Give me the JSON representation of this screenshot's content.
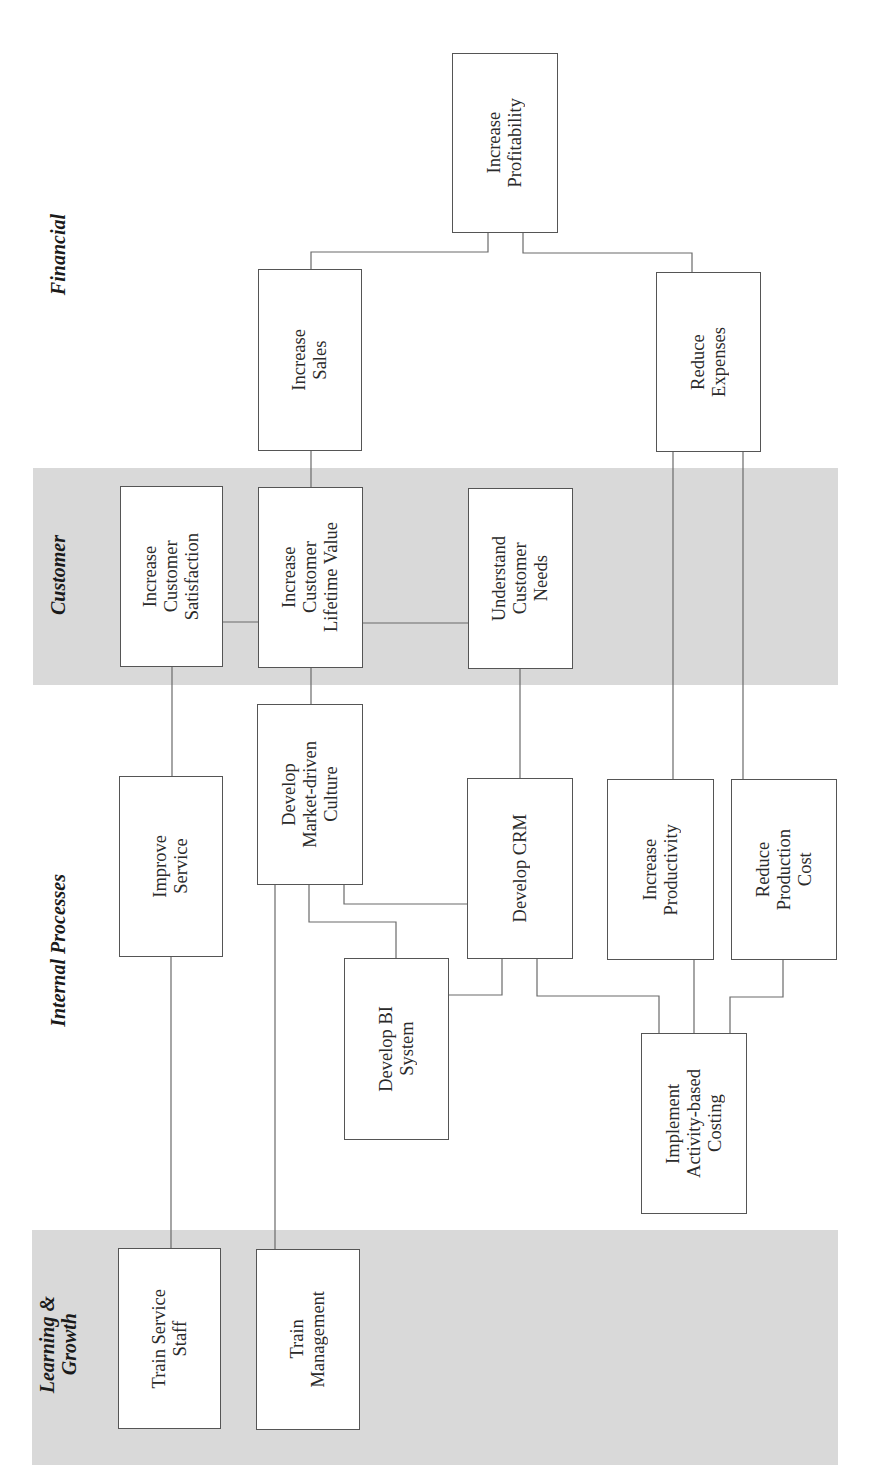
{
  "perspectives": {
    "financial": "Financial",
    "customer": "Customer",
    "internal": "Internal Processes",
    "learning": "Learning &\nGrowth"
  },
  "nodes": {
    "increase_profitability": "Increase\nProfitability",
    "increase_sales": "Increase\nSales",
    "reduce_expenses": "Reduce\nExpenses",
    "increase_customer_satisfaction": "Increase\nCustomer\nSatisfaction",
    "increase_customer_lifetime_value": "Increase\nCustomer\nLifetime Value",
    "understand_customer_needs": "Understand\nCustomer\nNeeds",
    "improve_service": "Improve\nService",
    "develop_market_driven_culture": "Develop\nMarket-driven\nCulture",
    "develop_crm": "Develop CRM",
    "increase_productivity": "Increase\nProductivity",
    "reduce_production_cost": "Reduce\nProduction\nCost",
    "develop_bi_system": "Develop BI\nSystem",
    "implement_activity_based_costing": "Implement\nActivity-based\nCosting",
    "train_service_staff": "Train Service\nStaff",
    "train_management": "Train\nManagement"
  },
  "colors": {
    "band": "#d9d9d9",
    "box_border": "#555555",
    "connector": "#6a6a6a"
  }
}
